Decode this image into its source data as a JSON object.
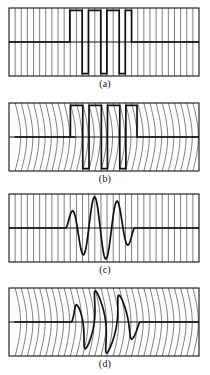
{
  "figure": {
    "width": 210,
    "height": 375,
    "background": "#ffffff",
    "ink_color": "#1a1a1a",
    "grid_color": "#555555",
    "axis_color": "#111111"
  },
  "panels": [
    {
      "id": "a",
      "label": "(a)",
      "caption_text": "(a)",
      "kind": "square-wave-burst",
      "grid_style": "straight",
      "frame": {
        "x": 9,
        "y": 8,
        "width": 190,
        "height": 68
      },
      "label_y": 78,
      "grid_lines": 31,
      "baseline_ratio": 0.5,
      "waveform_color": "#101010",
      "waveform_width": 1.7
    },
    {
      "id": "b",
      "label": "(b)",
      "caption_text": "(b)",
      "kind": "square-wave-burst",
      "grid_style": "curved",
      "frame": {
        "x": 9,
        "y": 103,
        "width": 190,
        "height": 68
      },
      "label_y": 173,
      "grid_lines": 31,
      "baseline_ratio": 0.5,
      "waveform_color": "#101010",
      "waveform_width": 1.7,
      "warp_amplitude": 5.5
    },
    {
      "id": "c",
      "label": "(c)",
      "caption_text": "(c)",
      "kind": "sinusoidal-burst",
      "grid_style": "straight",
      "frame": {
        "x": 9,
        "y": 194,
        "width": 190,
        "height": 68
      },
      "label_y": 264,
      "grid_lines": 31,
      "baseline_ratio": 0.5,
      "waveform_color": "#101010",
      "waveform_width": 1.7
    },
    {
      "id": "d",
      "label": "(d)",
      "caption_text": "(d)",
      "kind": "sinusoidal-burst",
      "grid_style": "curved",
      "frame": {
        "x": 9,
        "y": 288,
        "width": 190,
        "height": 68
      },
      "label_y": 358,
      "grid_lines": 31,
      "baseline_ratio": 0.5,
      "waveform_color": "#101010",
      "waveform_width": 1.7,
      "warp_amplitude": 5.5
    }
  ],
  "chart_data": {
    "type": "line",
    "title": "",
    "xlabel": "",
    "ylabel": "",
    "xlim": [
      0,
      1
    ],
    "ylim": [
      -1,
      1
    ],
    "grid": true,
    "legend": "none",
    "series": [
      {
        "name": "(a) rectangular burst",
        "panel": "a",
        "waveform": "square",
        "baseline_level": 0,
        "high_level": 1,
        "low_level": -1,
        "burst_start_x": 0.32,
        "burst_end_x": 0.645,
        "transitions_x": [
          0.32,
          0.385,
          0.418,
          0.483,
          0.515,
          0.58,
          0.612,
          0.645
        ],
        "levels": [
          1,
          -1,
          1,
          -1,
          1,
          -1,
          1,
          0
        ],
        "cycles": 3
      },
      {
        "name": "(b) rectangular burst, warped grid",
        "panel": "b",
        "waveform": "square",
        "baseline_level": 0,
        "high_level": 1,
        "low_level": -1,
        "burst_start_x": 0.32,
        "burst_end_x": 0.645,
        "transitions_x": [
          0.32,
          0.385,
          0.418,
          0.483,
          0.515,
          0.58,
          0.612,
          0.645
        ],
        "levels": [
          1,
          -1,
          1,
          -1,
          1,
          -1,
          1,
          0
        ],
        "cycles": 3,
        "grid_warped": true
      },
      {
        "name": "(c) sinusoidal burst",
        "panel": "c",
        "waveform": "sine-tapered",
        "baseline_level": 0,
        "peak_level": 1,
        "trough_level": -1,
        "burst_start_x": 0.3,
        "burst_end_x": 0.66,
        "cycles": 3,
        "peaks_x": [
          0.36,
          0.48,
          0.6
        ],
        "troughs_x": [
          0.42,
          0.54,
          0.655
        ]
      },
      {
        "name": "(d) sinusoidal burst, warped grid",
        "panel": "d",
        "waveform": "sine-tapered",
        "baseline_level": 0,
        "peak_level": 1,
        "trough_level": -1,
        "burst_start_x": 0.3,
        "burst_end_x": 0.66,
        "cycles": 3,
        "peaks_x": [
          0.36,
          0.48,
          0.6
        ],
        "troughs_x": [
          0.42,
          0.54,
          0.655
        ],
        "grid_warped": true
      }
    ]
  }
}
